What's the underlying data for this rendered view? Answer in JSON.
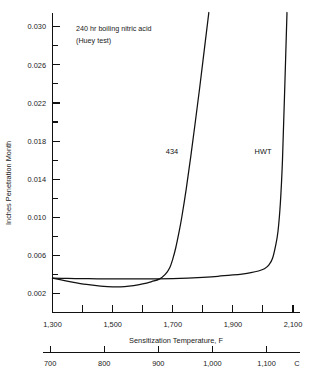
{
  "chart_data": {
    "type": "line",
    "title": "",
    "annotation_lines": [
      "240 hr boiling nitric acid",
      "(Huey test)"
    ],
    "xlabel": "Sensitization Temperature, F",
    "ylabel": "Inches Penetration Month",
    "x_secondary_unit_label": "C",
    "xlim": [
      1300,
      2100
    ],
    "ylim": [
      0,
      0.0315
    ],
    "grid": false,
    "legend_position": "inline-labels",
    "x_ticks_f": [
      "1,300",
      "1,400",
      "1,500",
      "1,600",
      "1,700",
      "1,800",
      "1,900",
      "2,000",
      "2,100"
    ],
    "x_tick_values_f": [
      1300,
      1400,
      1500,
      1600,
      1700,
      1800,
      1900,
      2000,
      2100
    ],
    "x_labeled_f": [
      "1,300",
      "1,500",
      "1,700",
      "1,900",
      "2,100"
    ],
    "x_labeled_values_f": [
      1300,
      1500,
      1700,
      1900,
      2100
    ],
    "x_ticks_c": [
      "700",
      "800",
      "900",
      "1,000",
      "1,100"
    ],
    "x_tick_values_c": [
      700,
      800,
      900,
      1000,
      1100
    ],
    "y_ticks": [
      "0.002",
      "0.006",
      "0.010",
      "0.014",
      "0.018",
      "0.022",
      "0.026",
      "0.030"
    ],
    "y_tick_values": [
      0.002,
      0.006,
      0.01,
      0.014,
      0.018,
      0.022,
      0.026,
      0.03
    ],
    "y_minor_values": [
      0.004,
      0.008,
      0.012,
      0.016,
      0.02,
      0.024,
      0.028
    ],
    "series": [
      {
        "name": "434",
        "label": "434",
        "color": "#111111",
        "x": [
          1300,
          1340,
          1380,
          1420,
          1460,
          1500,
          1540,
          1570,
          1600,
          1630,
          1655,
          1675,
          1690,
          1700,
          1710,
          1720,
          1730,
          1745,
          1760,
          1775,
          1790,
          1805,
          1820
        ],
        "y": [
          0.0036,
          0.00335,
          0.00312,
          0.00292,
          0.00278,
          0.0027,
          0.00272,
          0.00282,
          0.003,
          0.00325,
          0.0035,
          0.004,
          0.0047,
          0.0056,
          0.0068,
          0.0083,
          0.01,
          0.013,
          0.0164,
          0.02,
          0.0237,
          0.0276,
          0.0315
        ]
      },
      {
        "name": "HWT",
        "label": "HWT",
        "color": "#111111",
        "x": [
          1300,
          1350,
          1400,
          1450,
          1500,
          1550,
          1600,
          1650,
          1700,
          1750,
          1800,
          1850,
          1900,
          1930,
          1960,
          1985,
          2005,
          2020,
          2032,
          2042,
          2050,
          2058,
          2065,
          2072,
          2080
        ],
        "y": [
          0.0036,
          0.00358,
          0.00356,
          0.00354,
          0.00353,
          0.00352,
          0.00352,
          0.00353,
          0.00356,
          0.00362,
          0.0037,
          0.0038,
          0.00394,
          0.00404,
          0.00418,
          0.00436,
          0.0046,
          0.005,
          0.0057,
          0.007,
          0.0085,
          0.0115,
          0.016,
          0.023,
          0.0315
        ]
      }
    ]
  },
  "axes": {
    "y_title": "Inches Penetration Month",
    "x_title": "Sensitization Temperature, F",
    "c_axis_suffix": "C"
  },
  "annotation": {
    "line1": "240 hr boiling nitric acid",
    "line2": "(Huey test)"
  },
  "labels": {
    "series_434": "434",
    "series_hwt": "HWT"
  },
  "colors": {
    "ink": "#111111",
    "background": "#ffffff"
  }
}
